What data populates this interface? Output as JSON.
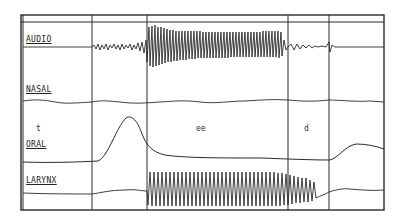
{
  "figure": {
    "channels": [
      {
        "id": "audio",
        "label": "AUDIO",
        "label_pos": [
          26,
          42
        ]
      },
      {
        "id": "nasal",
        "label": "NASAL",
        "label_pos": [
          26,
          91
        ]
      },
      {
        "id": "oral",
        "label": "ORAL",
        "label_pos": [
          26,
          141
        ]
      },
      {
        "id": "larynx",
        "label": "LARYNX",
        "label_pos": [
          26,
          182
        ]
      }
    ],
    "segments": [
      {
        "label": "t",
        "pos": [
          36,
          130
        ]
      },
      {
        "label": "ee",
        "pos": [
          196,
          130
        ]
      },
      {
        "label": "d",
        "pos": [
          303,
          130
        ]
      }
    ],
    "frame": {
      "left": 21,
      "top": 15,
      "right": 384,
      "bottom": 210,
      "header_line": 22
    },
    "dividers_x": [
      92,
      147,
      288,
      329
    ],
    "colors": {
      "ink": "#2a2a2a",
      "background": "#ffffff"
    }
  }
}
